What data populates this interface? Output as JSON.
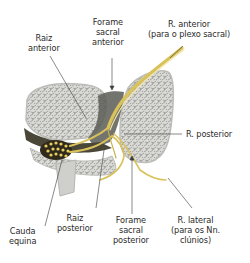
{
  "diagram": {
    "colors": {
      "bone_fill": "#d9d9d6",
      "bone_texture": "#8d8d8a",
      "bone_edge": "#bdbdb9",
      "canal_dark": "#4a4638",
      "nerve": "#d9c25a",
      "nerve_highlight": "#f3e7a6",
      "cauda_fill": "#2f2a1c",
      "cauda_dots": "#e6cf5e",
      "foramen_shadow": "#5c5c56",
      "leader_line": "#3a3a3a",
      "text": "#2b2b2b"
    }
  },
  "labels": {
    "raiz_anterior": {
      "line1": "Raiz",
      "line2": "anterior"
    },
    "forame_sacral_anterior": {
      "line1": "Forame",
      "line2": "sacral",
      "line3": "anterior"
    },
    "r_anterior": {
      "line1": "R. anterior",
      "line2": "(para o plexo sacral)"
    },
    "r_posterior": {
      "line1": "R. posterior"
    },
    "cauda_equina": {
      "line1": "Cauda",
      "line2": "equina"
    },
    "raiz_posterior": {
      "line1": "Raiz",
      "line2": "posterior"
    },
    "forame_sacral_posterior": {
      "line1": "Forame",
      "line2": "sacral",
      "line3": "posterior"
    },
    "r_lateral": {
      "line1": "R. lateral",
      "line2": "(para os Nn.",
      "line3": "clúnios)"
    }
  }
}
